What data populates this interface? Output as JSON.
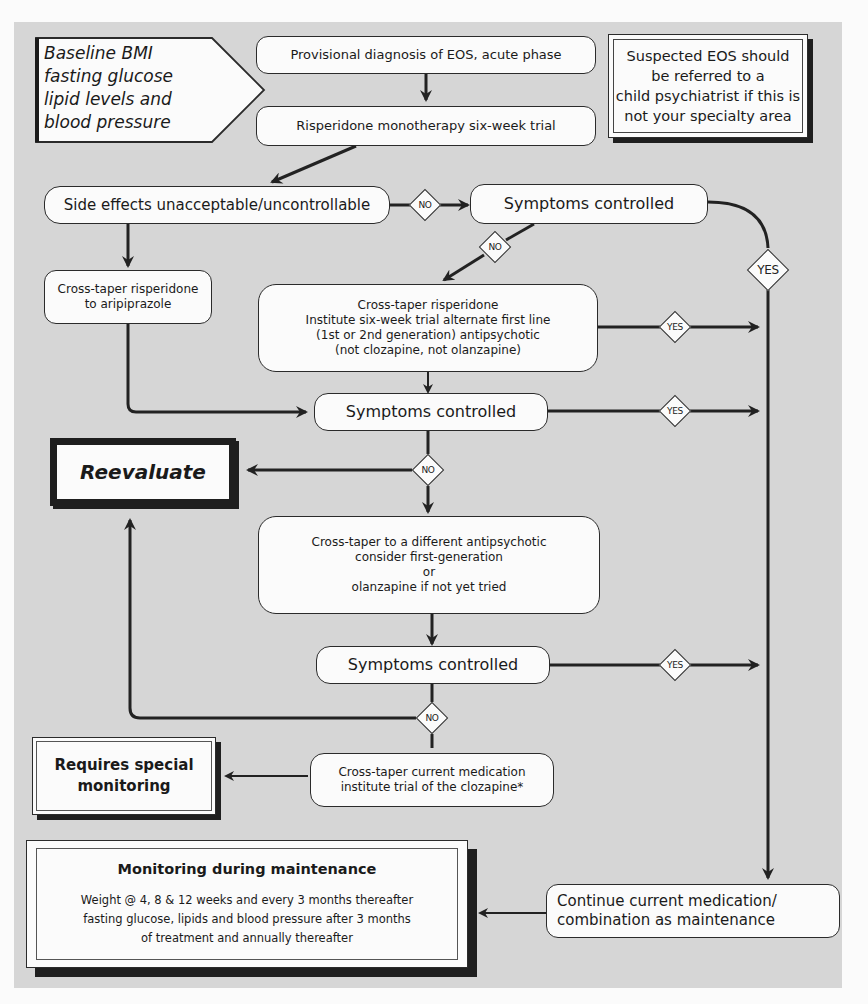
{
  "diagram": {
    "baseline": {
      "lines": [
        "Baseline BMI",
        "fasting glucose",
        "lipid levels and",
        "blood pressure"
      ]
    },
    "referral_note": {
      "lines": [
        "Suspected EOS should",
        "be referred to a",
        "child psychiatrist if this is",
        "not your specialty area"
      ]
    },
    "nodes": {
      "provisional": "Provisional diagnosis of EOS, acute phase",
      "risperidone_trial": "Risperidone monotherapy six-week trial",
      "side_effects": "Side effects unacceptable/uncontrollable",
      "symptoms_1": "Symptoms controlled",
      "cross_taper_aripiprazole": [
        "Cross-taper risperidone",
        "to aripiprazole"
      ],
      "cross_taper_alternate": [
        "Cross-taper risperidone",
        "Institute six-week trial alternate first line",
        "(1st or 2nd generation) antipsychotic",
        "(not clozapine, not olanzapine)"
      ],
      "symptoms_2": "Symptoms controlled",
      "reevaluate": "Reevaluate",
      "cross_taper_different": [
        "Cross-taper to a different antipsychotic",
        "consider first-generation",
        "or",
        "olanzapine if not yet tried"
      ],
      "symptoms_3": "Symptoms controlled",
      "requires_monitoring": [
        "Requires special",
        "monitoring"
      ],
      "clozapine": [
        "Cross-taper current medication",
        "institute trial of the clozapine*"
      ],
      "continue": [
        "Continue current medication/",
        "combination as maintenance"
      ]
    },
    "monitoring": {
      "title": "Monitoring during maintenance",
      "lines": [
        "Weight @ 4, 8 & 12 weeks and every 3 months thereafter",
        "fasting glucose, lipids and blood pressure after 3 months",
        "of treatment and annually thereafter"
      ]
    },
    "decisions": {
      "side_effects_no": "NO",
      "symptoms1_no": "NO",
      "symptoms1_yes": "YES",
      "alternate_yes": "YES",
      "symptoms2_yes": "YES",
      "symptoms2_no": "NO",
      "symptoms3_yes": "YES",
      "symptoms3_no": "NO"
    },
    "colors": {
      "panel": "#d6d6d6",
      "box_fill": "#fbfbfb",
      "stroke": "#2b2b2b",
      "page": "#fbfbfb"
    }
  }
}
